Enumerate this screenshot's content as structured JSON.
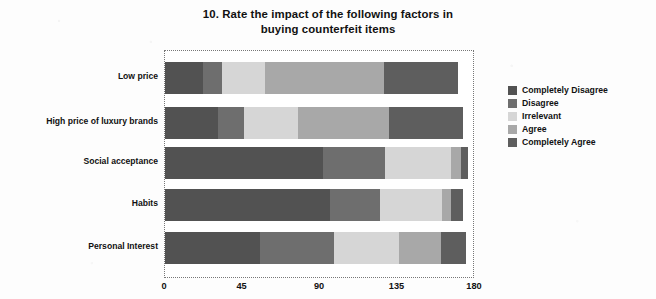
{
  "chart_data": {
    "type": "bar",
    "orientation": "horizontal",
    "stacked": true,
    "title": "10. Rate the impact of the following factors in buying counterfeit items",
    "title_lines": [
      "10. Rate the impact of the following factors in",
      "buying counterfeit items"
    ],
    "xlabel": "",
    "ylabel": "",
    "xlim": [
      0,
      180
    ],
    "xticks": [
      0,
      45,
      90,
      135,
      180
    ],
    "xtick_labels": [
      "0",
      "45",
      "90",
      "135",
      "180"
    ],
    "grid": false,
    "legend_position": "right",
    "categories": [
      "Low price",
      "High price of luxury brands",
      "Social acceptance",
      "Habits",
      "Personal Interest"
    ],
    "series": [
      {
        "name": "Completely Disagree",
        "color": "#525252",
        "values": [
          22,
          31,
          92,
          96,
          55
        ]
      },
      {
        "name": "Disagree",
        "color": "#6e6e6e",
        "values": [
          11,
          15,
          36,
          29,
          43
        ]
      },
      {
        "name": "Irrelevant",
        "color": "#d6d6d6",
        "values": [
          25,
          31,
          38,
          36,
          38
        ]
      },
      {
        "name": "Agree",
        "color": "#a8a8a8",
        "values": [
          69,
          53,
          6,
          5,
          24
        ]
      },
      {
        "name": "Completely Agree",
        "color": "#5e5e5e",
        "values": [
          43,
          43,
          4,
          7,
          15
        ]
      }
    ],
    "totals": [
      170,
      173,
      176,
      173,
      175
    ],
    "units": "respondents"
  },
  "legend": {
    "items": [
      {
        "label": "Completely Disagree",
        "swatch": "#525252"
      },
      {
        "label": "Disagree",
        "swatch": "#6e6e6e"
      },
      {
        "label": "Irrelevant",
        "swatch": "#d6d6d6"
      },
      {
        "label": "Agree",
        "swatch": "#a8a8a8"
      },
      {
        "label": "Completely Agree",
        "swatch": "#5e5e5e"
      }
    ]
  },
  "colors": {
    "background": "#fdfdfd",
    "plot_background": "#ffffff",
    "plot_border": "#777777",
    "text": "#111111"
  }
}
